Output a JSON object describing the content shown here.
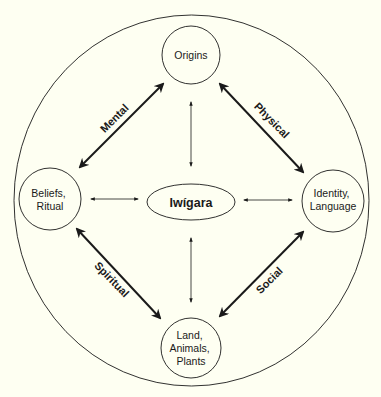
{
  "diagram": {
    "background": "#FEFFF2",
    "stroke_color": "#1a1a1a",
    "center": {
      "label": "Iwígara"
    },
    "nodes": [
      {
        "id": "origins",
        "lines": [
          "Origins"
        ]
      },
      {
        "id": "beliefs",
        "lines": [
          "Beliefs,",
          "Ritual"
        ]
      },
      {
        "id": "identity",
        "lines": [
          "Identity,",
          "Language"
        ]
      },
      {
        "id": "land",
        "lines": [
          "Land,",
          "Animals,",
          "Plants"
        ]
      }
    ],
    "edges": [
      {
        "from": "beliefs",
        "to": "origins",
        "label": "Mental",
        "weight": "bold"
      },
      {
        "from": "origins",
        "to": "identity",
        "label": "Physical",
        "weight": "bold"
      },
      {
        "from": "beliefs",
        "to": "land",
        "label": "Spiritual",
        "weight": "bold"
      },
      {
        "from": "land",
        "to": "identity",
        "label": "Social",
        "weight": "bold"
      },
      {
        "from": "origins",
        "to": "center",
        "label": "",
        "weight": "thin"
      },
      {
        "from": "beliefs",
        "to": "center",
        "label": "",
        "weight": "thin"
      },
      {
        "from": "identity",
        "to": "center",
        "label": "",
        "weight": "thin"
      },
      {
        "from": "land",
        "to": "center",
        "label": "",
        "weight": "thin"
      }
    ]
  }
}
